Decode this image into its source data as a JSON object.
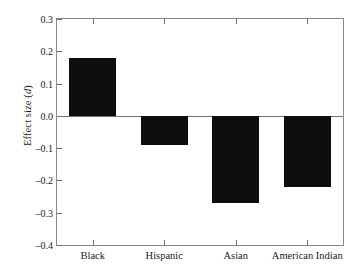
{
  "chart_data": {
    "type": "bar",
    "title": "",
    "subtitle": "",
    "xlabel": "",
    "ylabel": "Effect size (d)",
    "ylabel_plain": "Effect size",
    "ylabel_italic_symbol": "d",
    "categories": [
      "Black",
      "Hispanic",
      "Asian",
      "American Indian"
    ],
    "values": [
      0.18,
      -0.09,
      -0.27,
      -0.22
    ],
    "ylim": [
      -0.4,
      0.3
    ],
    "ytick_values": [
      0.3,
      0.2,
      0.1,
      0.0,
      -0.1,
      -0.2,
      -0.3,
      -0.4
    ],
    "ytick_labels": [
      "0.3",
      "0.2",
      "0.1",
      "0.0",
      "–0.1",
      "–0.2",
      "–0.3",
      "–0.4"
    ],
    "grid": false,
    "legend": false,
    "legend_position": "none",
    "bar_color": "#0d0d0d",
    "axis_color": "#8a8a8a",
    "background_color": "#ffffff",
    "zero_baseline": 0.0,
    "series": [
      {
        "name": "Effect size",
        "values": [
          0.18,
          -0.09,
          -0.27,
          -0.22
        ]
      }
    ]
  }
}
